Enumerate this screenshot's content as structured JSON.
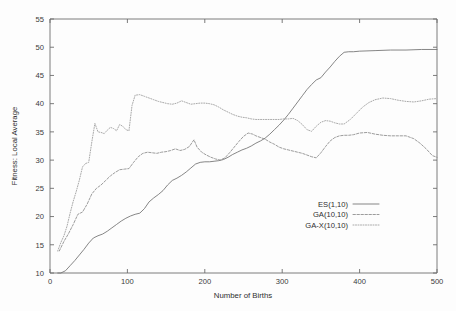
{
  "chart_data": {
    "type": "line",
    "title": "",
    "xlabel": "Number of Births",
    "ylabel": "Fitness: Local Average",
    "xlim": [
      0,
      500
    ],
    "ylim": [
      10,
      55
    ],
    "xticks": [
      0,
      100,
      200,
      300,
      400,
      500
    ],
    "yticks": [
      10,
      15,
      20,
      25,
      30,
      35,
      40,
      45,
      50,
      55
    ],
    "grid": false,
    "legend_position": "center-right",
    "legend_entries": [
      {
        "label": "ES(1,10)",
        "style": "solid",
        "color": "#707070"
      },
      {
        "label": "GA(10,10)",
        "style": "dashed",
        "color": "#8a8a8a"
      },
      {
        "label": "GA-X(10,10)",
        "style": "dotted",
        "color": "#9a9a9a"
      }
    ],
    "series": [
      {
        "name": "ES(1,10)",
        "style": "solid",
        "color": "#707070",
        "x": [
          10,
          14,
          20,
          26,
          32,
          38,
          44,
          50,
          56,
          62,
          68,
          74,
          80,
          86,
          92,
          98,
          104,
          110,
          116,
          122,
          128,
          134,
          140,
          146,
          152,
          158,
          164,
          170,
          176,
          182,
          188,
          194,
          200,
          206,
          212,
          218,
          224,
          230,
          236,
          242,
          248,
          254,
          260,
          266,
          272,
          278,
          284,
          290,
          296,
          302,
          308,
          314,
          320,
          326,
          332,
          338,
          344,
          350,
          356,
          362,
          368,
          374,
          380,
          386,
          392,
          400,
          420,
          440,
          460,
          480,
          500
        ],
        "y": [
          10.0,
          10.0,
          10.4,
          11.3,
          12.2,
          13.2,
          14.2,
          15.3,
          16.2,
          16.6,
          16.9,
          17.4,
          18.0,
          18.6,
          19.2,
          19.7,
          20.1,
          20.4,
          20.6,
          21.4,
          22.6,
          23.3,
          23.9,
          24.6,
          25.6,
          26.4,
          26.8,
          27.3,
          27.9,
          28.6,
          29.3,
          29.6,
          29.7,
          29.7,
          29.8,
          29.9,
          30.1,
          30.5,
          31.0,
          31.4,
          31.8,
          32.1,
          32.5,
          33.0,
          33.4,
          33.9,
          34.6,
          35.4,
          36.2,
          37.1,
          38.1,
          39.2,
          40.3,
          41.4,
          42.5,
          43.4,
          44.2,
          44.6,
          45.6,
          46.5,
          47.5,
          48.4,
          49.1,
          49.2,
          49.2,
          49.3,
          49.4,
          49.5,
          49.5,
          49.6,
          49.6
        ]
      },
      {
        "name": "GA(10,10)",
        "style": "dashed",
        "color": "#8a8a8a",
        "x": [
          12,
          18,
          24,
          30,
          36,
          42,
          48,
          54,
          60,
          66,
          72,
          78,
          84,
          90,
          96,
          102,
          108,
          114,
          120,
          126,
          132,
          138,
          144,
          150,
          156,
          162,
          168,
          174,
          180,
          186,
          190,
          196,
          202,
          208,
          214,
          220,
          226,
          232,
          238,
          244,
          250,
          256,
          262,
          266,
          272,
          278,
          284,
          290,
          296,
          302,
          308,
          314,
          320,
          326,
          332,
          338,
          344,
          350,
          356,
          362,
          368,
          374,
          380,
          386,
          392,
          400,
          410,
          420,
          430,
          440,
          450,
          460,
          470,
          478,
          486,
          494,
          500
        ],
        "y": [
          13.9,
          15.6,
          17.0,
          18.6,
          20.4,
          20.8,
          22.2,
          24.0,
          25.0,
          25.6,
          26.4,
          27.2,
          27.8,
          28.3,
          28.4,
          28.5,
          29.6,
          30.6,
          31.2,
          31.4,
          31.3,
          31.2,
          31.4,
          31.5,
          31.7,
          32.0,
          31.7,
          31.9,
          32.4,
          33.6,
          32.3,
          31.4,
          30.9,
          30.5,
          30.2,
          30.0,
          30.4,
          31.3,
          32.3,
          33.3,
          34.2,
          34.8,
          34.6,
          34.3,
          34.0,
          33.7,
          33.2,
          32.8,
          32.3,
          32.0,
          31.8,
          31.6,
          31.4,
          31.2,
          30.9,
          30.6,
          30.4,
          31.3,
          32.4,
          33.4,
          34.0,
          34.3,
          34.4,
          34.4,
          34.5,
          34.8,
          34.9,
          34.6,
          34.4,
          34.3,
          34.3,
          34.3,
          33.8,
          33.0,
          32.0,
          30.8,
          30.5
        ]
      },
      {
        "name": "GA-X(10,10)",
        "style": "dotted",
        "color": "#9a9a9a",
        "x": [
          10,
          14,
          18,
          22,
          26,
          30,
          34,
          38,
          42,
          46,
          50,
          54,
          58,
          62,
          66,
          70,
          74,
          78,
          82,
          86,
          90,
          94,
          98,
          102,
          106,
          110,
          116,
          122,
          128,
          134,
          140,
          146,
          152,
          158,
          164,
          170,
          176,
          182,
          188,
          194,
          200,
          206,
          212,
          218,
          224,
          230,
          236,
          242,
          248,
          254,
          260,
          266,
          272,
          278,
          284,
          290,
          296,
          302,
          308,
          314,
          320,
          326,
          332,
          338,
          344,
          350,
          356,
          362,
          368,
          374,
          380,
          388,
          396,
          404,
          412,
          420,
          430,
          440,
          450,
          460,
          470,
          480,
          490,
          500
        ],
        "y": [
          13.9,
          15.4,
          16.6,
          18.3,
          20.6,
          22.7,
          24.5,
          26.5,
          28.8,
          29.4,
          29.6,
          33.2,
          36.5,
          35.0,
          34.9,
          34.7,
          35.3,
          35.8,
          35.6,
          35.2,
          36.3,
          36.0,
          35.4,
          35.2,
          39.7,
          41.5,
          41.6,
          41.3,
          41.0,
          40.7,
          40.4,
          40.2,
          40.0,
          39.9,
          40.1,
          40.5,
          40.2,
          39.9,
          40.0,
          40.1,
          40.1,
          40.0,
          39.8,
          39.4,
          38.9,
          38.5,
          38.1,
          37.8,
          37.6,
          37.5,
          37.3,
          37.2,
          37.2,
          37.2,
          37.2,
          37.2,
          37.2,
          37.3,
          37.3,
          37.4,
          37.0,
          36.3,
          35.4,
          35.1,
          36.0,
          36.7,
          37.0,
          36.9,
          36.6,
          36.4,
          36.4,
          37.2,
          38.3,
          39.4,
          40.2,
          40.7,
          41.0,
          40.9,
          40.6,
          40.4,
          40.3,
          40.5,
          40.8,
          40.9
        ]
      }
    ]
  },
  "axes": {
    "y_title": "Fitness: Local Average",
    "x_title": "Number of Births",
    "y_tick_labels": [
      "10",
      "15",
      "20",
      "25",
      "30",
      "35",
      "40",
      "45",
      "50",
      "55"
    ],
    "x_tick_labels": [
      "0",
      "100",
      "200",
      "300",
      "400",
      "500"
    ]
  },
  "legend": {
    "items": [
      {
        "label": "ES(1,10)"
      },
      {
        "label": "GA(10,10)"
      },
      {
        "label": "GA-X(10,10)"
      }
    ]
  }
}
